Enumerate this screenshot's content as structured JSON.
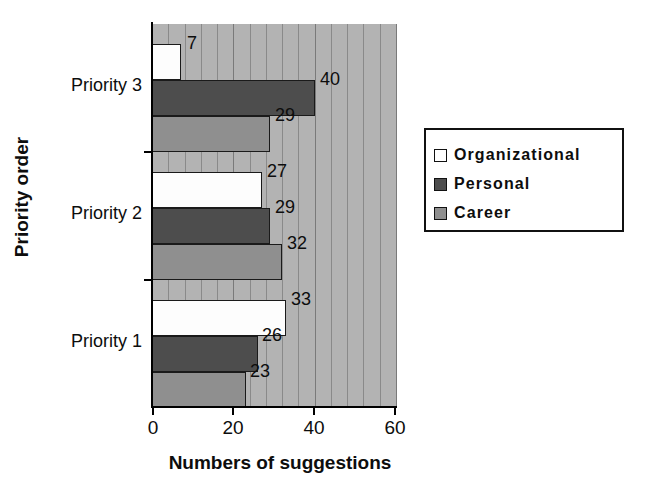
{
  "chart_data": {
    "type": "bar",
    "orientation": "horizontal",
    "title": "",
    "xlabel": "Numbers of suggestions",
    "ylabel": "Priority order",
    "categories": [
      "Priority 1",
      "Priority 2",
      "Priority 3"
    ],
    "series": [
      {
        "name": "Organizational",
        "color": "#ffffff",
        "values": [
          33,
          27,
          7
        ]
      },
      {
        "name": "Personal",
        "color": "#4d4d4d",
        "values": [
          26,
          29,
          40
        ]
      },
      {
        "name": "Career",
        "color": "#8f8f8f",
        "values": [
          23,
          32,
          29
        ]
      }
    ],
    "xlim": [
      0,
      60
    ],
    "xticks": [
      0,
      20,
      40,
      60
    ],
    "xtick_labels": [
      "0",
      "20",
      "40",
      "60"
    ],
    "minor_tick_step": 4,
    "grid": "vertical-minor-and-major",
    "plot_background": "#b3b3b3",
    "legend_position": "right",
    "value_labels_shown": true
  },
  "axes": {
    "y_tick_labels": [
      "Priority 1",
      "Priority 2",
      "Priority 3"
    ],
    "x_tick_labels": [
      "0",
      "20",
      "40",
      "60"
    ],
    "x_axis_title": "Numbers of suggestions",
    "y_axis_title": "Priority order"
  },
  "legend": {
    "items": [
      {
        "label": "Organizational",
        "swatch": "legend-swatch-organizational"
      },
      {
        "label": "Personal",
        "swatch": "legend-swatch-personal"
      },
      {
        "label": "Career",
        "swatch": "legend-swatch-career"
      }
    ]
  },
  "value_labels": {
    "priority3": {
      "organizational": "7",
      "personal": "40",
      "career": "29"
    },
    "priority2": {
      "organizational": "27",
      "personal": "29",
      "career": "32"
    },
    "priority1": {
      "organizational": "33",
      "personal": "26",
      "career": "23"
    }
  }
}
